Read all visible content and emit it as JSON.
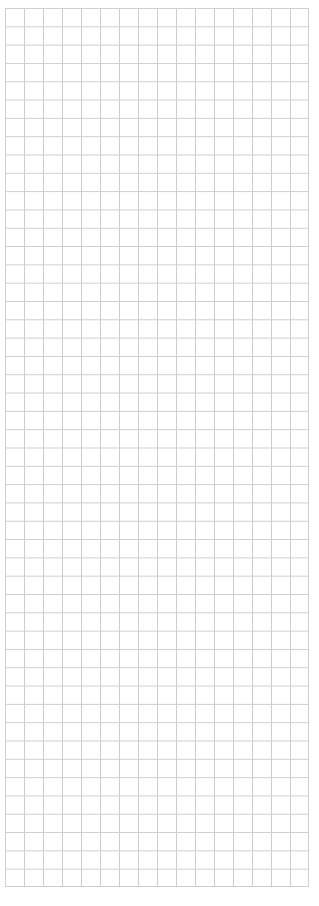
{
  "grid": {
    "columns": 16,
    "rows": 48,
    "cell_width_px": 19,
    "cell_height_px": 18.3,
    "line_color": "#cdcdcd",
    "background_color": "#ffffff"
  }
}
